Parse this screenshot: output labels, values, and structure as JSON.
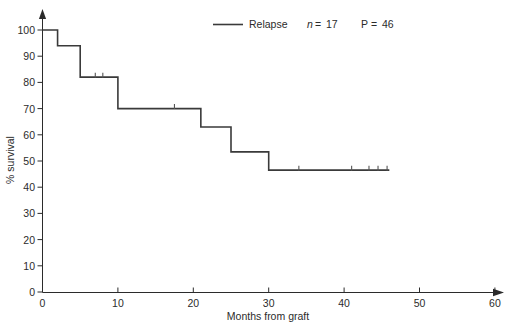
{
  "figure": {
    "background_color": "#ffffff",
    "line_color": "#3a3a3a",
    "axis_color": "#2b2b2b"
  },
  "legend": {
    "series_label": "Relapse",
    "n_label": "n",
    "n_equals": "=",
    "n_value": "17",
    "p_label": "P",
    "p_equals": "=",
    "p_value": "46",
    "n_text": "n = 17",
    "p_text": "P = 46"
  },
  "axes": {
    "x_title": "Months from graft",
    "y_title": "% survival",
    "x_ticks": [
      "0",
      "10",
      "20",
      "30",
      "40",
      "50",
      "60"
    ],
    "y_ticks": [
      "0",
      "10",
      "20",
      "30",
      "40",
      "50",
      "60",
      "70",
      "80",
      "90",
      "100"
    ]
  },
  "chart_data": {
    "type": "line",
    "title": "",
    "subtitle": "",
    "xlabel": "Months from graft",
    "ylabel": "% survival",
    "xlim": [
      0,
      60
    ],
    "ylim": [
      0,
      100
    ],
    "xticks": [
      0,
      10,
      20,
      30,
      40,
      50,
      60
    ],
    "yticks": [
      0,
      10,
      20,
      30,
      40,
      50,
      60,
      70,
      80,
      90,
      100
    ],
    "grid": false,
    "legend_position": "top-center",
    "style": "step-post",
    "series": [
      {
        "name": "Relapse",
        "n": 17,
        "p": 46,
        "x": [
          0,
          2,
          2,
          5,
          5,
          10,
          10,
          21,
          21,
          25,
          25,
          30,
          30,
          46
        ],
        "y": [
          100,
          100,
          94,
          94,
          82,
          82,
          70,
          70,
          63,
          63,
          53.5,
          53.5,
          46.5,
          46.5
        ],
        "steps": [
          {
            "time": 0,
            "survival": 100
          },
          {
            "time": 2,
            "survival": 94
          },
          {
            "time": 5,
            "survival": 82
          },
          {
            "time": 10,
            "survival": 70
          },
          {
            "time": 21,
            "survival": 63
          },
          {
            "time": 25,
            "survival": 53.5
          },
          {
            "time": 30,
            "survival": 46.5
          },
          {
            "time": 46,
            "survival": 46.5
          }
        ],
        "censored": [
          {
            "time": 7.0,
            "survival": 82
          },
          {
            "time": 8.0,
            "survival": 82
          },
          {
            "time": 17.5,
            "survival": 70
          },
          {
            "time": 34.0,
            "survival": 46.5
          },
          {
            "time": 41.0,
            "survival": 46.5
          },
          {
            "time": 43.3,
            "survival": 46.5
          },
          {
            "time": 44.5,
            "survival": 46.5
          },
          {
            "time": 45.7,
            "survival": 46.5
          }
        ]
      }
    ],
    "annotations": [
      "n = 17",
      "P = 46"
    ]
  },
  "cropped_header": {
    "fragments": [
      "",
      "",
      ""
    ]
  }
}
